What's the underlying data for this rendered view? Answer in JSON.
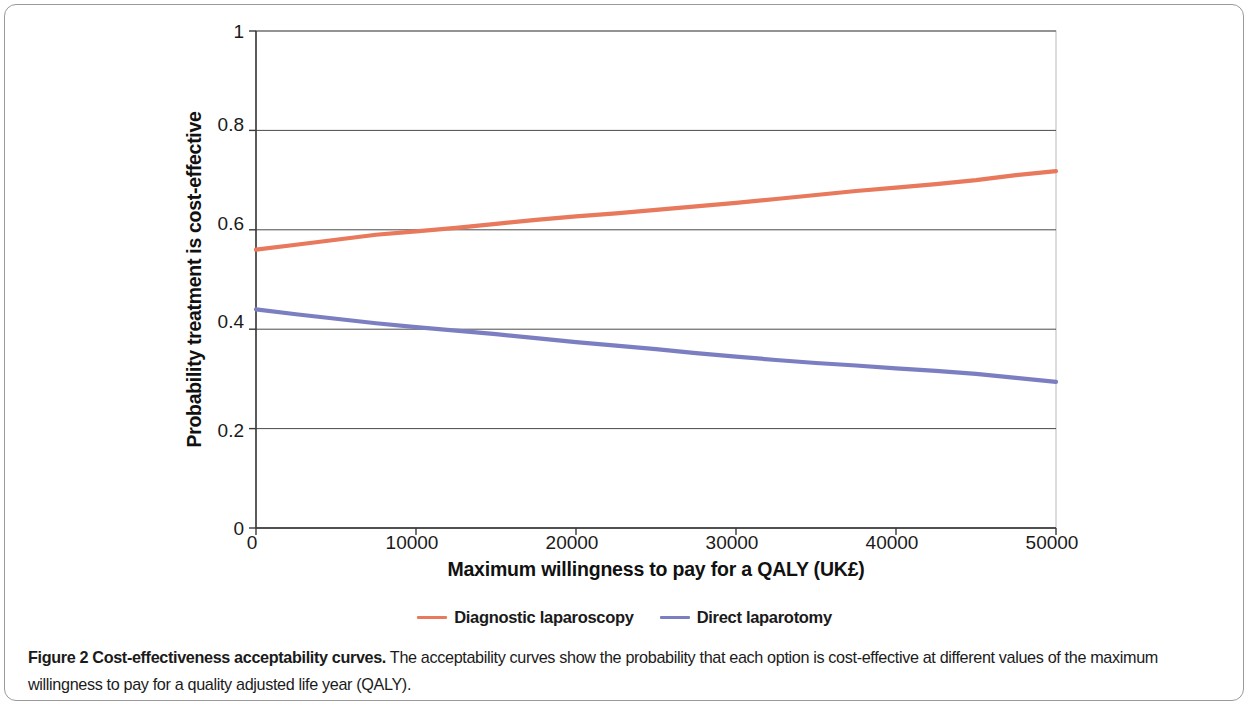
{
  "figure": {
    "caption_bold": "Figure 2 Cost-effectiveness acceptability curves.",
    "caption_rest": " The acceptability curves show the probability that each option is cost-effective at different values of the maximum willingness to pay for a quality adjusted life year (QALY)."
  },
  "legend": {
    "entries": [
      {
        "label": "Diagnostic laparoscopy",
        "color": "#E8795C"
      },
      {
        "label": "Direct laparotomy",
        "color": "#7B7FC2"
      }
    ]
  },
  "axes": {
    "x_title": "Maximum willingness to pay for a QALY (UK£)",
    "y_title": "Probability treatment is cost-effective",
    "x_ticks": [
      "0",
      "10000",
      "20000",
      "30000",
      "40000",
      "50000"
    ],
    "y_ticks": [
      "1",
      "0.8",
      "0.6",
      "0.4",
      "0.2",
      "0"
    ]
  },
  "chart_data": {
    "type": "line",
    "title": "Cost-effectiveness acceptability curves",
    "xlabel": "Maximum willingness to pay for a QALY (UK£)",
    "ylabel": "Probability treatment is cost-effective",
    "xlim": [
      0,
      50000
    ],
    "ylim": [
      0,
      1
    ],
    "xticks": [
      0,
      10000,
      20000,
      30000,
      40000,
      50000
    ],
    "yticks": [
      0,
      0.2,
      0.4,
      0.6,
      0.8,
      1
    ],
    "grid": "horizontal",
    "legend_position": "bottom-center",
    "x": [
      0,
      2500,
      5000,
      7500,
      10000,
      12500,
      15000,
      17500,
      20000,
      22500,
      25000,
      27500,
      30000,
      32500,
      35000,
      37500,
      40000,
      42500,
      45000,
      47500,
      50000
    ],
    "series": [
      {
        "name": "Diagnostic laparoscopy",
        "color": "#E8795C",
        "values": [
          0.56,
          0.57,
          0.58,
          0.59,
          0.597,
          0.604,
          0.612,
          0.62,
          0.627,
          0.633,
          0.64,
          0.647,
          0.654,
          0.662,
          0.67,
          0.678,
          0.685,
          0.692,
          0.7,
          0.71,
          0.718
        ]
      },
      {
        "name": "Direct laparotomy",
        "color": "#7B7FC2",
        "values": [
          0.44,
          0.43,
          0.421,
          0.412,
          0.404,
          0.397,
          0.39,
          0.382,
          0.374,
          0.367,
          0.36,
          0.352,
          0.345,
          0.338,
          0.332,
          0.327,
          0.321,
          0.316,
          0.31,
          0.302,
          0.294
        ]
      }
    ]
  }
}
